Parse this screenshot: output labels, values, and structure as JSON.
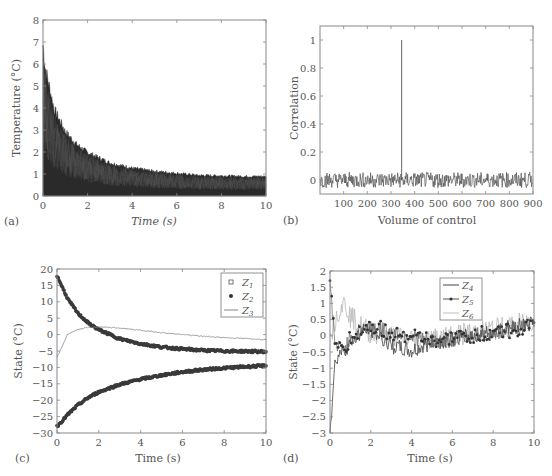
{
  "chart_data": [
    {
      "panel": "(a)",
      "type": "line",
      "title": "",
      "xlabel": "Time (s)",
      "ylabel": "Temperature (°C)",
      "xlim": [
        0,
        10
      ],
      "ylim": [
        0,
        8
      ],
      "xticks": [
        0,
        2,
        4,
        6,
        8,
        10
      ],
      "yticks": [
        0,
        1,
        2,
        3,
        4,
        5,
        6,
        7,
        8
      ],
      "grid": false,
      "description": "Many overlapping decaying noisy traces filling the area beneath an envelope",
      "envelope": {
        "x": [
          0,
          0.1,
          0.5,
          1,
          1.5,
          2,
          3,
          4,
          5,
          6,
          7,
          8,
          9,
          10
        ],
        "y": [
          7.3,
          6.2,
          4.2,
          3.1,
          2.5,
          2.1,
          1.6,
          1.35,
          1.2,
          1.1,
          1.0,
          0.98,
          0.95,
          0.95
        ]
      }
    },
    {
      "panel": "(b)",
      "type": "line",
      "title": "",
      "xlabel": "Volume of control",
      "ylabel": "Correlation",
      "xlim": [
        0,
        900
      ],
      "ylim": [
        -0.1,
        1.1
      ],
      "xticks": [
        100,
        200,
        300,
        400,
        500,
        600,
        700,
        800,
        900
      ],
      "yticks": [
        0,
        0.2,
        0.4,
        0.6,
        0.8,
        1
      ],
      "grid": false,
      "description": "Noise around 0 (±0.07) with a single spike of 1.0 at x≈345",
      "spike": {
        "x": 345,
        "y": 1.0
      },
      "noise_amplitude": 0.07
    },
    {
      "panel": "(c)",
      "type": "line",
      "title": "",
      "xlabel": "Time (s)",
      "ylabel": "State (°C)",
      "xlim": [
        0,
        10
      ],
      "ylim": [
        -30,
        20
      ],
      "xticks": [
        0,
        2,
        4,
        6,
        8,
        10
      ],
      "yticks": [
        -30,
        -25,
        -20,
        -15,
        -10,
        -5,
        0,
        5,
        10,
        15,
        20
      ],
      "grid": false,
      "legend": {
        "position": "upper right",
        "entries": [
          "Z1",
          "Z2",
          "Z3"
        ]
      },
      "x": [
        0,
        0.5,
        1,
        1.5,
        2,
        3,
        4,
        5,
        6,
        7,
        8,
        9,
        10
      ],
      "series": [
        {
          "name": "Z1",
          "marker": "square",
          "values": [
            -28,
            -24.5,
            -21.5,
            -19.2,
            -17.5,
            -15.2,
            -13.6,
            -12.4,
            -11.4,
            -10.7,
            -10.2,
            -9.8,
            -9.5
          ]
        },
        {
          "name": "Z2",
          "marker": "dot",
          "values": [
            18,
            11,
            6.5,
            3.5,
            1.5,
            -1.3,
            -2.8,
            -3.8,
            -4.4,
            -4.8,
            -5.0,
            -5.1,
            -5.2
          ]
        },
        {
          "name": "Z3",
          "marker": "line",
          "values": [
            -7,
            0,
            1.6,
            2.2,
            2.3,
            2.0,
            1.3,
            0.6,
            0.0,
            -0.5,
            -0.9,
            -1.2,
            -1.5
          ]
        }
      ]
    },
    {
      "panel": "(d)",
      "type": "line",
      "title": "",
      "xlabel": "Time (s)",
      "ylabel": "State (°C)",
      "xlim": [
        0,
        10
      ],
      "ylim": [
        -3,
        2
      ],
      "xticks": [
        0,
        2,
        4,
        6,
        8,
        10
      ],
      "yticks": [
        -3,
        -2.5,
        -2,
        -1.5,
        -1,
        -0.5,
        0,
        0.5,
        1,
        1.5,
        2
      ],
      "grid": false,
      "legend": {
        "position": "upper center-right",
        "entries": [
          "Z4",
          "Z5",
          "Z6"
        ]
      },
      "x": [
        0,
        0.25,
        0.5,
        0.75,
        1,
        1.5,
        2,
        3,
        4,
        5,
        6,
        7,
        8,
        9,
        10
      ],
      "series": [
        {
          "name": "Z4",
          "marker": "line",
          "values": [
            -3,
            -0.8,
            -0.5,
            -0.4,
            -0.2,
            0.1,
            0.2,
            -0.3,
            -0.5,
            -0.2,
            -0.1,
            0.0,
            0.1,
            0.3,
            0.4
          ]
        },
        {
          "name": "Z5",
          "marker": "dot-line",
          "values": [
            1.7,
            -0.3,
            -0.4,
            -0.3,
            -0.1,
            0.2,
            0.3,
            0.1,
            0.0,
            -0.2,
            -0.1,
            0.0,
            0.1,
            0.2,
            0.3
          ]
        },
        {
          "name": "Z6",
          "marker": "light-line",
          "values": [
            0,
            0.5,
            0.9,
            1.0,
            0.6,
            0.3,
            0.1,
            0.0,
            -0.1,
            -0.1,
            0.0,
            0.1,
            0.2,
            0.3,
            0.5
          ]
        }
      ]
    }
  ],
  "panels": {
    "a": {
      "tag": "(a)",
      "xlabel": "Time (s)",
      "ylabel": "Temperature (°C)"
    },
    "b": {
      "tag": "(b)",
      "xlabel": "Volume of control",
      "ylabel": "Correlation"
    },
    "c": {
      "tag": "(c)",
      "xlabel": "Time (s)",
      "ylabel": "State (°C)",
      "legend": [
        "Z",
        "Z",
        "Z"
      ],
      "legend_sub": [
        "1",
        "2",
        "3"
      ]
    },
    "d": {
      "tag": "(d)",
      "xlabel": "Time (s)",
      "ylabel": "State (°C)",
      "legend": [
        "Z",
        "Z",
        "Z"
      ],
      "legend_sub": [
        "4",
        "5",
        "6"
      ]
    }
  },
  "colors": {
    "axis": "#777777",
    "trace_dark": "#3a3a3a",
    "trace_mid": "#666666",
    "trace_light": "#b5b5b5"
  }
}
